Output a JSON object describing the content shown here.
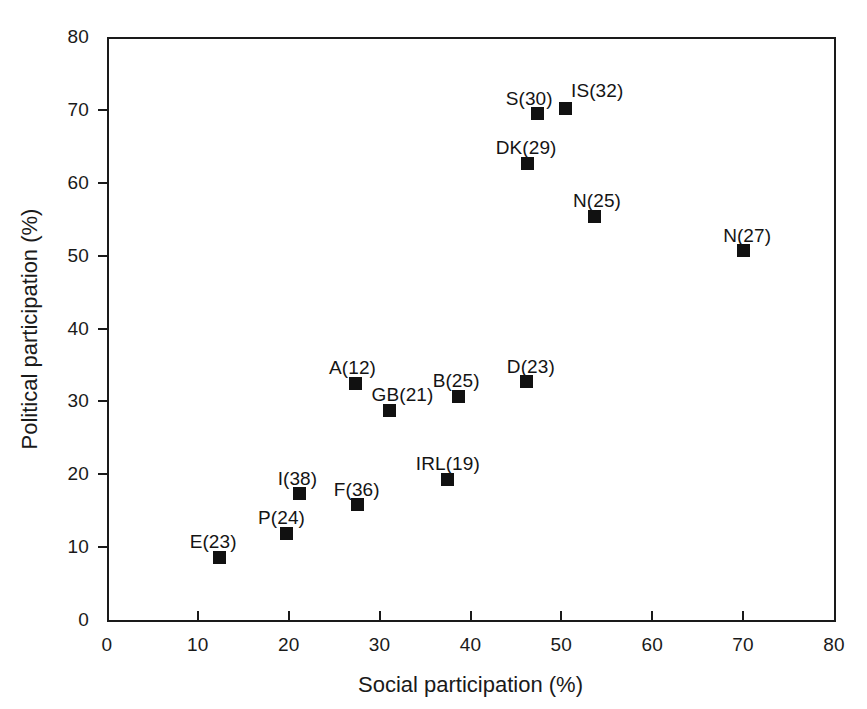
{
  "chart_data": {
    "type": "scatter",
    "title": "",
    "xlabel": "Social participation (%)",
    "ylabel": "Political participation (%)",
    "xlim": [
      0,
      80
    ],
    "ylim": [
      0,
      80
    ],
    "xticks": [
      0,
      10,
      20,
      30,
      40,
      50,
      60,
      70,
      80
    ],
    "xticklabels": [
      "0",
      "10",
      "20",
      "30",
      "40",
      "50",
      "60",
      "70",
      "80"
    ],
    "yticks": [
      0,
      10,
      20,
      30,
      40,
      50,
      60,
      70,
      80
    ],
    "yticklabels": [
      "0",
      "10",
      "20",
      "30",
      "40",
      "50",
      "60",
      "70",
      "80"
    ],
    "grid": false,
    "legend": false,
    "marker_style": "filled-square",
    "marker_color": "#111111",
    "points": [
      {
        "label": "E(23)",
        "x": 12.4,
        "y": 8.6,
        "label_dx": -30,
        "label_dy": -26
      },
      {
        "label": "P(24)",
        "x": 19.7,
        "y": 11.9,
        "label_dx": -28,
        "label_dy": -26
      },
      {
        "label": "I(38)",
        "x": 21.2,
        "y": 17.3,
        "label_dx": -22,
        "label_dy": -26
      },
      {
        "label": "F(36)",
        "x": 27.6,
        "y": 15.8,
        "label_dx": -24,
        "label_dy": -26
      },
      {
        "label": "A(12)",
        "x": 27.3,
        "y": 32.5,
        "label_dx": -26,
        "label_dy": -26
      },
      {
        "label": "GB(21)",
        "x": 31.1,
        "y": 28.8,
        "label_dx": -18,
        "label_dy": -26
      },
      {
        "label": "IRL(19)",
        "x": 37.5,
        "y": 19.3,
        "label_dx": -32,
        "label_dy": -26
      },
      {
        "label": "B(25)",
        "x": 38.7,
        "y": 30.7,
        "label_dx": -26,
        "label_dy": -26
      },
      {
        "label": "D(23)",
        "x": 46.2,
        "y": 32.7,
        "label_dx": -20,
        "label_dy": -26
      },
      {
        "label": "DK(29)",
        "x": 46.3,
        "y": 62.7,
        "label_dx": -32,
        "label_dy": -26
      },
      {
        "label": "S(30)",
        "x": 47.4,
        "y": 69.5,
        "label_dx": -32,
        "label_dy": -26
      },
      {
        "label": "IS(32)",
        "x": 50.4,
        "y": 70.2,
        "label_dx": 6,
        "label_dy": -28
      },
      {
        "label": "N(25)",
        "x": 53.7,
        "y": 55.4,
        "label_dx": -22,
        "label_dy": -26
      },
      {
        "label": "N(27)",
        "x": 70.0,
        "y": 50.7,
        "label_dx": -20,
        "label_dy": -26
      }
    ]
  }
}
